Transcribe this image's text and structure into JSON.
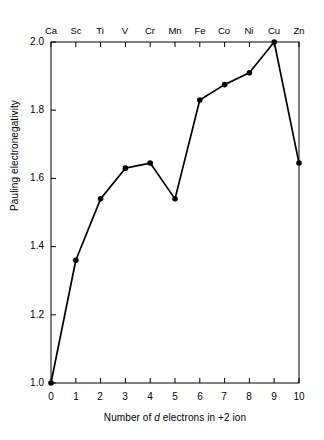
{
  "chart_data": {
    "type": "line",
    "title": "",
    "xlabel": "Number of d electrons in +2 ion",
    "ylabel": "Pauling electronegativity",
    "xlim": [
      0,
      10
    ],
    "ylim": [
      1.0,
      2.0
    ],
    "grid": false,
    "legend": "none",
    "x": [
      0,
      1,
      2,
      3,
      4,
      5,
      6,
      7,
      8,
      9,
      10
    ],
    "values": [
      1.0,
      1.36,
      1.54,
      1.63,
      1.645,
      1.54,
      1.83,
      1.875,
      1.91,
      2.0,
      1.645
    ],
    "x_tick_labels": [
      "0",
      "1",
      "2",
      "3",
      "4",
      "5",
      "6",
      "7",
      "8",
      "9",
      "10"
    ],
    "y_tick_labels": [
      "1.0",
      "1.2",
      "1.4",
      "1.6",
      "1.8",
      "2.0"
    ],
    "y_ticks": [
      1.0,
      1.2,
      1.4,
      1.6,
      1.8,
      2.0
    ],
    "top_axis_labels": [
      "Ca",
      "Sc",
      "Ti",
      "V",
      "Cr",
      "Mn",
      "Fe",
      "Co",
      "Ni",
      "Cu",
      "Zn"
    ],
    "series_name": "Pauling electronegativity",
    "marker": "filled-circle",
    "line_color": "#000000",
    "marker_color": "#000000",
    "axis_color": "#000000",
    "background_color": "#ffffff"
  }
}
